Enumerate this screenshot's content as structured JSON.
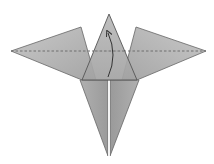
{
  "diagram": {
    "type": "origami-fold-step",
    "colors": {
      "background": "#ffffff",
      "paper_light": "#c4c4c4",
      "paper_mid": "#ababab",
      "paper_dark": "#8f8f8f",
      "edge": "#555555",
      "fold_line": "#6e6e6e",
      "arrow": "#333333",
      "slit": "#ffffff"
    },
    "elements": {
      "left_wing": {
        "points": "11,51 81,27 96,80 82,80"
      },
      "right_wing": {
        "points": "206,51 136,27 122,80 137,80"
      },
      "center_flap": {
        "points": "109,14 82,80 137,80"
      },
      "left_leg": {
        "points": "80,80 108,80 108,156"
      },
      "right_leg": {
        "points": "110,80 139,80 110,156"
      },
      "valley_fold_line": {
        "x1": 11,
        "y1": 51,
        "x2": 206,
        "y2": 51,
        "style": "dashed"
      },
      "fold_arrow": {
        "path": "M108,77 Q118,55 108,33",
        "direction": "up"
      }
    }
  }
}
